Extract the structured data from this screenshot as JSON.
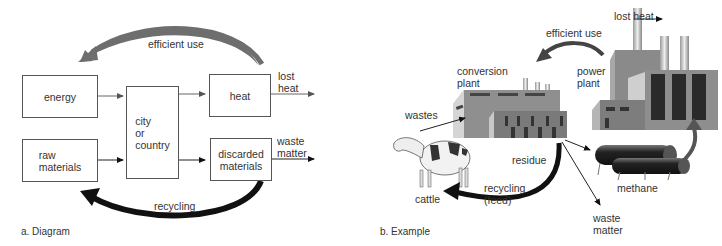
{
  "panel_a": {
    "caption": "a. Diagram",
    "boxes": {
      "energy": "energy",
      "raw_materials": "raw\nmaterials",
      "city": "city\nor\ncountry",
      "heat": "heat",
      "discarded": "discarded\nmaterials"
    },
    "labels": {
      "efficient_use": "efficient use",
      "lost_heat": "lost\nheat",
      "waste_matter": "waste\nmatter",
      "recycling": "recycling"
    }
  },
  "panel_b": {
    "caption": "b. Example",
    "labels": {
      "lost_heat": "lost heat",
      "efficient_use": "efficient use",
      "conversion_plant": "conversion\nplant",
      "power_plant": "power\nplant",
      "wastes": "wastes",
      "residue": "residue",
      "recycling_feed": "recycling\n(feed)",
      "cattle": "cattle",
      "methane": "methane",
      "waste_matter": "waste\nmatter"
    }
  },
  "colors": {
    "arrow_gray": "#6e6e6e",
    "arrow_black": "#111111",
    "factory_wall": "#9a9a9a",
    "factory_dark": "#3a3a3a"
  }
}
